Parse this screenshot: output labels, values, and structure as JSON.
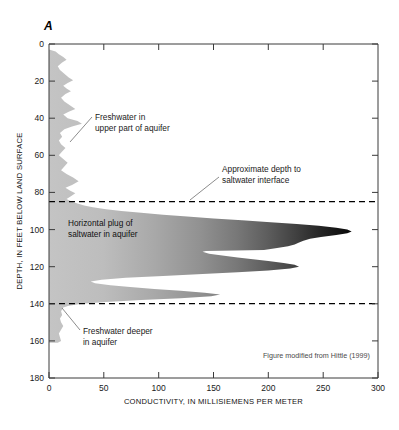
{
  "figure": {
    "panel_label": "A",
    "source_note": "Figure modified from Hittle (1999)"
  },
  "chart_data": {
    "type": "area",
    "title": "",
    "xlabel": "CONDUCTIVITY, IN MILLISIEMENS PER METER",
    "ylabel": "DEPTH, IN FEET BELOW LAND SURFACE",
    "xlim": [
      0,
      300
    ],
    "ylim": [
      180,
      0
    ],
    "y_inverted": true,
    "grid": false,
    "legend": "none",
    "xticks": [
      0,
      50,
      100,
      150,
      200,
      250,
      300
    ],
    "xticklabels": [
      "0",
      "50",
      "100",
      "150",
      "200",
      "250",
      "300"
    ],
    "yticks": [
      0,
      20,
      40,
      60,
      80,
      100,
      120,
      140,
      160,
      180
    ],
    "yticklabels": [
      "0",
      "20",
      "40",
      "60",
      "80",
      "100",
      "120",
      "140",
      "160",
      "180"
    ],
    "series": [
      {
        "name": "Conductivity profile",
        "x_label": "conductivity_ms_per_m",
        "y_label": "depth_ft",
        "fill": "grayscale-gradient-by-conductivity",
        "points": [
          [
            0,
            3
          ],
          [
            6,
            4
          ],
          [
            9,
            5.5
          ],
          [
            13,
            7
          ],
          [
            16,
            8.5
          ],
          [
            12,
            10
          ],
          [
            8,
            12
          ],
          [
            10,
            14
          ],
          [
            14,
            16
          ],
          [
            18,
            18
          ],
          [
            22,
            19.5
          ],
          [
            17,
            21
          ],
          [
            13,
            22.5
          ],
          [
            16,
            24
          ],
          [
            20,
            25.5
          ],
          [
            15,
            27
          ],
          [
            11,
            29
          ],
          [
            14,
            31
          ],
          [
            19,
            33
          ],
          [
            24,
            35
          ],
          [
            18,
            36.5
          ],
          [
            13,
            38
          ],
          [
            17,
            40
          ],
          [
            26,
            41.5
          ],
          [
            30,
            43
          ],
          [
            21,
            44.5
          ],
          [
            14,
            46
          ],
          [
            10,
            48
          ],
          [
            12,
            50
          ],
          [
            9,
            52
          ],
          [
            11,
            54
          ],
          [
            15,
            56
          ],
          [
            12,
            58
          ],
          [
            9,
            60
          ],
          [
            13,
            62
          ],
          [
            17,
            64
          ],
          [
            14,
            66
          ],
          [
            11,
            68
          ],
          [
            16,
            70
          ],
          [
            22,
            72
          ],
          [
            27,
            74
          ],
          [
            21,
            76
          ],
          [
            15,
            77.5
          ],
          [
            19,
            79
          ],
          [
            24,
            80.5
          ],
          [
            20,
            82
          ],
          [
            16,
            83.5
          ],
          [
            21,
            85
          ],
          [
            26,
            86
          ],
          [
            32,
            87
          ],
          [
            40,
            88
          ],
          [
            52,
            89
          ],
          [
            66,
            90
          ],
          [
            84,
            91
          ],
          [
            104,
            92
          ],
          [
            126,
            93
          ],
          [
            150,
            94
          ],
          [
            176,
            95
          ],
          [
            202,
            96
          ],
          [
            226,
            97
          ],
          [
            246,
            98
          ],
          [
            262,
            99
          ],
          [
            272,
            100
          ],
          [
            276,
            101
          ],
          [
            272,
            102
          ],
          [
            262,
            103
          ],
          [
            248,
            104
          ],
          [
            238,
            105
          ],
          [
            232,
            106
          ],
          [
            228,
            107
          ],
          [
            224,
            108
          ],
          [
            218,
            109
          ],
          [
            208,
            110
          ],
          [
            196,
            111
          ],
          [
            143,
            111.5
          ],
          [
            140,
            112
          ],
          [
            146,
            113
          ],
          [
            158,
            114
          ],
          [
            172,
            115
          ],
          [
            186,
            116
          ],
          [
            200,
            117
          ],
          [
            214,
            118
          ],
          [
            224,
            119
          ],
          [
            228,
            120
          ],
          [
            220,
            121
          ],
          [
            200,
            122
          ],
          [
            172,
            123
          ],
          [
            140,
            124
          ],
          [
            104,
            125
          ],
          [
            70,
            126
          ],
          [
            48,
            127
          ],
          [
            38,
            128
          ],
          [
            42,
            129
          ],
          [
            56,
            130
          ],
          [
            74,
            131
          ],
          [
            96,
            132
          ],
          [
            120,
            133
          ],
          [
            142,
            134
          ],
          [
            156,
            135
          ],
          [
            148,
            136
          ],
          [
            120,
            137
          ],
          [
            84,
            138
          ],
          [
            52,
            139
          ],
          [
            30,
            140
          ],
          [
            18,
            141
          ],
          [
            13,
            142
          ],
          [
            11,
            144
          ],
          [
            12,
            146
          ],
          [
            10,
            148
          ],
          [
            11,
            150
          ],
          [
            13,
            152
          ],
          [
            11,
            154
          ],
          [
            9,
            156
          ],
          [
            10,
            158
          ],
          [
            11,
            160
          ],
          [
            8,
            161
          ]
        ]
      }
    ],
    "reference_lines": [
      {
        "name": "saltwater-interface-upper",
        "depth_ft": 85,
        "style": "dashed"
      },
      {
        "name": "saltwater-interface-lower",
        "depth_ft": 140,
        "style": "dashed"
      }
    ],
    "annotations": [
      {
        "id": "freshwater-upper",
        "lines": [
          "Freshwater in",
          "upper part of aquifer"
        ],
        "points_to_depth_ft": 53,
        "points_to_conductivity": 12
      },
      {
        "id": "saltwater-interface",
        "lines": [
          "Approximate depth to",
          "saltwater interface"
        ],
        "points_to_depth_ft": 85,
        "points_to_conductivity": 148
      },
      {
        "id": "horizontal-plug",
        "lines": [
          "Horizontal plug of",
          "saltwater in aquifer"
        ],
        "points_to_depth_ft": 100,
        "points_to_conductivity": 20
      },
      {
        "id": "freshwater-deeper",
        "lines": [
          "Freshwater deeper",
          "in aquifer"
        ],
        "points_to_depth_ft": 143,
        "points_to_conductivity": 10
      }
    ]
  },
  "colors": {
    "axis": "#3a3a3a",
    "freshwater_fill": "#bdbdbd",
    "saltwater_peak": "#0a0a0a",
    "interface_line": "#000000",
    "leader_line": "#6e6e6e",
    "background": "#ffffff"
  }
}
